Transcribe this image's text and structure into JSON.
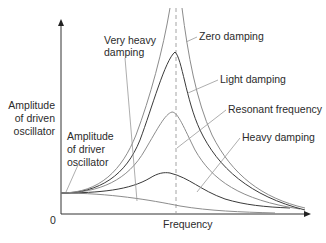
{
  "diagram": {
    "y_axis": {
      "label_lines": [
        "Amplitude",
        "of driven",
        "oscillator"
      ],
      "origin_label": "0"
    },
    "x_axis": {
      "label": "Frequency"
    },
    "labels": {
      "very_heavy": [
        "Very heavy",
        "damping"
      ],
      "zero": "Zero damping",
      "light": "Light damping",
      "resonant": "Resonant frequency",
      "heavy": "Heavy damping",
      "driver": [
        "Amplitude",
        "of driver",
        "oscillator"
      ]
    },
    "colors": {
      "dark_curve": "#3a3a3a",
      "gray_curve": "#8c8c8c",
      "axis": "#333333",
      "dashed": "#9a9a9a",
      "text": "#2b2b2b"
    }
  }
}
